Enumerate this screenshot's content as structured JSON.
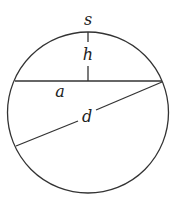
{
  "diagram": {
    "labels": {
      "s": "s",
      "h": "h",
      "a": "a",
      "d": "d"
    },
    "colors": {
      "stroke": "#333333",
      "background": "#ffffff"
    }
  }
}
